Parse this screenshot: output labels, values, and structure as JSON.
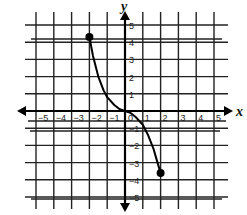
{
  "chart_data": {
    "type": "line",
    "title": "",
    "xlabel": "x",
    "ylabel": "y",
    "xlim": [
      -5,
      5
    ],
    "ylim": [
      -5,
      5
    ],
    "grid": true,
    "legend": null,
    "x_ticks": [
      "-5",
      "-4",
      "-3",
      "-2",
      "-1",
      "0",
      "1",
      "2",
      "3",
      "4",
      "5"
    ],
    "y_ticks": [
      "5",
      "4",
      "3",
      "2",
      "1",
      "-1",
      "-2",
      "-3",
      "-4",
      "-5"
    ],
    "series": [
      {
        "name": "curve",
        "x": [
          -2,
          -1.8,
          -1.5,
          -1.2,
          -1,
          -0.6,
          -0.3,
          0,
          0.3,
          0.6,
          1,
          1.3,
          1.6,
          1.8,
          2
        ],
        "y": [
          4.3,
          3.2,
          2.0,
          1.2,
          0.8,
          0.35,
          0.1,
          0,
          -0.1,
          -0.35,
          -0.8,
          -1.4,
          -2.2,
          -2.9,
          -3.6
        ]
      }
    ],
    "endpoints": [
      {
        "x": -2,
        "y": 4.3,
        "style": "closed"
      },
      {
        "x": 2,
        "y": -3.6,
        "style": "closed"
      }
    ]
  },
  "labels": {
    "x_axis": "x",
    "y_axis": "y"
  }
}
